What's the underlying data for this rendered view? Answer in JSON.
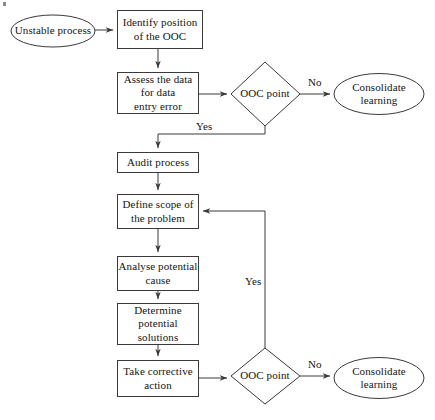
{
  "diagram": {
    "stroke_color": "#3a3a3a",
    "text_color": "#141414",
    "background_color": "#ffffff",
    "nodes": [
      {
        "id": "unstable-process",
        "shape": "ellipse",
        "label": "Unstable process"
      },
      {
        "id": "identify-position",
        "shape": "rectangle",
        "label": "Identify position\nof the OOC"
      },
      {
        "id": "assess-data",
        "shape": "rectangle",
        "label": "Assess the data\nfor data\nentry error"
      },
      {
        "id": "ooc-point-top",
        "shape": "diamond",
        "label": "OOC point"
      },
      {
        "id": "consolidate-learning-top",
        "shape": "ellipse",
        "label": "Consolidate\nlearning"
      },
      {
        "id": "audit-process",
        "shape": "rectangle",
        "label": "Audit process"
      },
      {
        "id": "define-scope",
        "shape": "rectangle",
        "label": "Define scope of\nthe problem"
      },
      {
        "id": "analyse-cause",
        "shape": "rectangle",
        "label": "Analyse potential\ncause"
      },
      {
        "id": "determine-solutions",
        "shape": "rectangle",
        "label": "Determine\npotential\nsolutions"
      },
      {
        "id": "take-corrective-action",
        "shape": "rectangle",
        "label": "Take corrective\naction"
      },
      {
        "id": "ooc-point-bottom",
        "shape": "diamond",
        "label": "OOC point"
      },
      {
        "id": "consolidate-learning-bottom",
        "shape": "ellipse",
        "label": "Consolidate\nlearning"
      }
    ],
    "edges": [
      {
        "id": "edge-unstable-to-identify",
        "from": "unstable-process",
        "to": "identify-position",
        "label": ""
      },
      {
        "id": "edge-identify-to-assess",
        "from": "identify-position",
        "to": "assess-data",
        "label": ""
      },
      {
        "id": "edge-assess-to-ooc-top",
        "from": "assess-data",
        "to": "ooc-point-top",
        "label": ""
      },
      {
        "id": "edge-ooc-top-no",
        "from": "ooc-point-top",
        "to": "consolidate-learning-top",
        "label": "No"
      },
      {
        "id": "edge-ooc-top-yes",
        "from": "ooc-point-top",
        "to": "audit-process",
        "label": "Yes"
      },
      {
        "id": "edge-audit-to-define",
        "from": "audit-process",
        "to": "define-scope",
        "label": ""
      },
      {
        "id": "edge-define-to-analyse",
        "from": "define-scope",
        "to": "analyse-cause",
        "label": ""
      },
      {
        "id": "edge-analyse-to-determine",
        "from": "analyse-cause",
        "to": "determine-solutions",
        "label": ""
      },
      {
        "id": "edge-determine-to-action",
        "from": "determine-solutions",
        "to": "take-corrective-action",
        "label": ""
      },
      {
        "id": "edge-action-to-ooc-bottom",
        "from": "take-corrective-action",
        "to": "ooc-point-bottom",
        "label": ""
      },
      {
        "id": "edge-ooc-bottom-no",
        "from": "ooc-point-bottom",
        "to": "consolidate-learning-bottom",
        "label": "No"
      },
      {
        "id": "edge-ooc-bottom-yes",
        "from": "ooc-point-bottom",
        "to": "define-scope",
        "label": "Yes"
      }
    ],
    "labels": {
      "unstable_process": "Unstable process",
      "identify_position": "Identify position\nof the OOC",
      "assess_data": "Assess the data\nfor data\nentry error",
      "ooc_point_top": "OOC point",
      "consolidate_learning_top": "Consolidate\nlearning",
      "audit_process": "Audit process",
      "define_scope": "Define scope of\nthe problem",
      "analyse_cause": "Analyse potential\ncause",
      "determine_solutions": "Determine\npotential\nsolutions",
      "take_corrective_action": "Take corrective\naction",
      "ooc_point_bottom": "OOC point",
      "consolidate_learning_bottom": "Consolidate\nlearning",
      "no_top": "No",
      "yes_top": "Yes",
      "no_bottom": "No",
      "yes_bottom": "Yes"
    }
  }
}
